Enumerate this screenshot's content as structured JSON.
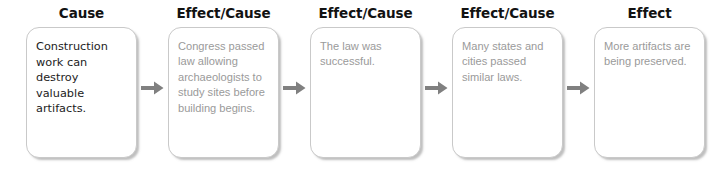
{
  "diagram": {
    "background_color": "#ffffff",
    "arrow_color": "#808080",
    "box_border_color": "#c9c9c9",
    "header_color": "#121212",
    "first_box_text_color": "#1c1c1c",
    "muted_box_text_color": "#9a9a9a",
    "stages": [
      {
        "header": "Cause",
        "text": "Construction work can destroy valuable artifacts.",
        "style": "dark"
      },
      {
        "header": "Effect/Cause",
        "text": "Congress passed law allowing archaeologists to study sites before building begins.",
        "style": "muted"
      },
      {
        "header": "Effect/Cause",
        "text": "The law was successful.",
        "style": "muted"
      },
      {
        "header": "Effect/Cause",
        "text": "Many states and cities passed similar laws.",
        "style": "muted"
      },
      {
        "header": "Effect",
        "text": "More artifacts are being preserved.",
        "style": "muted"
      }
    ],
    "arrows": [
      {
        "name": "arrow-1",
        "from": "Cause",
        "to": "Effect/Cause"
      },
      {
        "name": "arrow-2",
        "from": "Effect/Cause",
        "to": "Effect/Cause"
      },
      {
        "name": "arrow-3",
        "from": "Effect/Cause",
        "to": "Effect/Cause"
      },
      {
        "name": "arrow-4",
        "from": "Effect/Cause",
        "to": "Effect"
      }
    ]
  }
}
